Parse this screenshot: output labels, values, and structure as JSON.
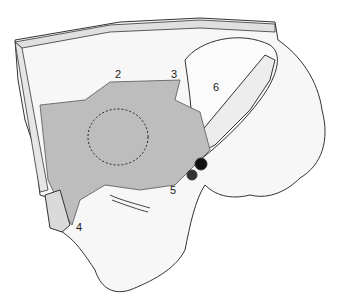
{
  "figure": {
    "type": "anatomical-illustration",
    "style": "grayscale line drawing",
    "colors": {
      "outline": "#333333",
      "shaded_region": "#b8b8b8",
      "light_fill": "#f4f4f4",
      "background": "#ffffff",
      "vessel_dark": "#111111"
    },
    "labels": [
      {
        "id": "2",
        "text": "2",
        "x": 115,
        "y": 69
      },
      {
        "id": "3",
        "text": "3",
        "x": 171,
        "y": 69
      },
      {
        "id": "4",
        "text": "4",
        "x": 76,
        "y": 222
      },
      {
        "id": "5",
        "text": "5",
        "x": 170,
        "y": 185
      },
      {
        "id": "6",
        "text": "6",
        "x": 213,
        "y": 82
      }
    ]
  }
}
